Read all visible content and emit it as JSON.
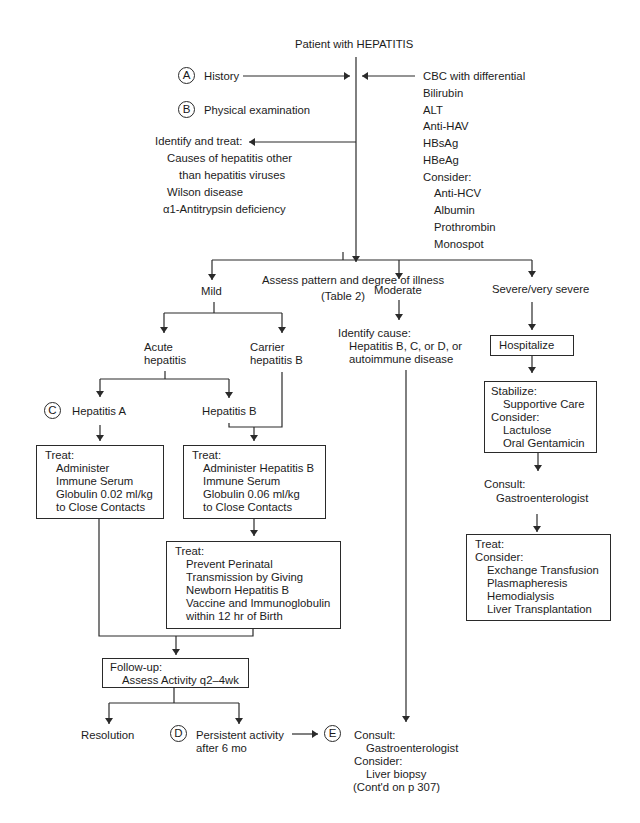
{
  "title": "Patient with HEPATITIS",
  "initial": {
    "steps": [
      {
        "marker": "A",
        "label": "History"
      },
      {
        "marker": "B",
        "label": "Physical examination"
      }
    ],
    "identify_and_treat": {
      "heading": "Identify and treat:",
      "items": [
        "Causes of hepatitis other",
        "than hepatitis viruses",
        "Wilson disease",
        "α1-Antitrypsin deficiency"
      ]
    },
    "labs": {
      "items": [
        "CBC with differential",
        "Bilirubin",
        "ALT",
        "Anti-HAV",
        "HBsAg",
        "HBeAg"
      ],
      "consider_heading": "Consider:",
      "consider_items": [
        "Anti-HCV",
        "Albumin",
        "Prothrombin",
        "Monospot"
      ]
    }
  },
  "assess": {
    "line1": "Assess pattern and degree of illness",
    "line2": "(Table 2)"
  },
  "branches": {
    "mild": {
      "label": "Mild",
      "acute": {
        "line1": "Acute",
        "line2": "hepatitis"
      },
      "carrier": {
        "line1": "Carrier",
        "line2": "hepatitis B"
      },
      "hep_a": {
        "marker": "C",
        "label": "Hepatitis A",
        "treat": {
          "heading": "Treat:",
          "lines": [
            "Administer",
            "Immune Serum",
            "Globulin 0.02 ml/kg",
            "to Close Contacts"
          ]
        }
      },
      "hep_b": {
        "label": "Hepatitis B",
        "treat": {
          "heading": "Treat:",
          "lines": [
            "Administer Hepatitis B",
            "Immune Serum",
            "Globulin 0.06 ml/kg",
            "to Close Contacts"
          ]
        },
        "treat2": {
          "heading": "Treat:",
          "lines": [
            "Prevent Perinatal",
            "Transmission by Giving",
            "Newborn Hepatitis B",
            "Vaccine and Immunoglobulin",
            "within 12 hr of Birth"
          ]
        }
      },
      "followup": {
        "heading": "Follow-up:",
        "line": "Assess Activity q2–4wk"
      },
      "resolution": "Resolution",
      "persistent": {
        "marker": "D",
        "line1": "Persistent activity",
        "line2": "after 6 mo"
      }
    },
    "moderate": {
      "label": "Moderate",
      "identify": {
        "heading": "Identify cause:",
        "lines": [
          "Hepatitis B, C, or D, or",
          "autoimmune disease"
        ]
      }
    },
    "severe": {
      "label": "Severe/very severe",
      "hospitalize": "Hospitalize",
      "stabilize": {
        "heading": "Stabilize:",
        "line": "Supportive Care",
        "consider_heading": "Consider:",
        "consider_items": [
          "Lactulose",
          "Oral Gentamicin"
        ]
      },
      "consult": {
        "heading": "Consult:",
        "line": "Gastroenterologist"
      },
      "treat": {
        "heading": "Treat:",
        "consider_heading": "Consider:",
        "items": [
          "Exchange Transfusion",
          "Plasmapheresis",
          "Hemodialysis",
          "Liver Transplantation"
        ]
      }
    }
  },
  "final": {
    "marker": "E",
    "consult_heading": "Consult:",
    "consult_line": "Gastroenterologist",
    "consider_heading": "Consider:",
    "consider_line": "Liver biopsy",
    "continued": "(Cont'd on p 307)"
  }
}
